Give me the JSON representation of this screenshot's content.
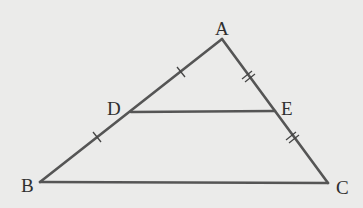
{
  "figure": {
    "type": "triangle-midsegment",
    "background": "#ebebea",
    "stroke_color": "#555555",
    "label_color": "#2f2f2f",
    "points": {
      "A": {
        "label": "A",
        "x": 222,
        "y": 39
      },
      "B": {
        "label": "B",
        "x": 40,
        "y": 182
      },
      "C": {
        "label": "C",
        "x": 328,
        "y": 183
      },
      "D": {
        "label": "D",
        "x": 131,
        "y": 112
      },
      "E": {
        "label": "E",
        "x": 275,
        "y": 111
      }
    },
    "segments": [
      "AB",
      "AC",
      "BC",
      "DE"
    ],
    "tick_marks": [
      {
        "segment": "AD",
        "count": 1
      },
      {
        "segment": "DB",
        "count": 1
      },
      {
        "segment": "AE",
        "count": 2
      },
      {
        "segment": "EC",
        "count": 2
      }
    ]
  }
}
